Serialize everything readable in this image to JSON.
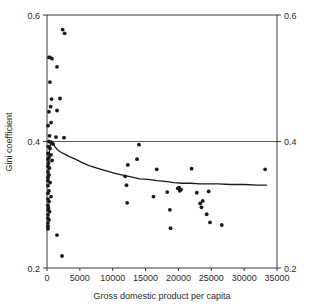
{
  "chart_data": {
    "type": "scatter",
    "title": "",
    "subtitle": "",
    "xlabel": "Gross domestic product per capita",
    "ylabel": "Gini coefficient",
    "xlim": [
      0,
      35000
    ],
    "ylim": [
      0.2,
      0.6
    ],
    "grid": false,
    "legend": null,
    "legend_position": "none",
    "x_ticks": [
      0,
      5000,
      10000,
      15000,
      20000,
      25000,
      30000,
      35000
    ],
    "x_tick_labels": [
      "0",
      "5000",
      "10000",
      "15000",
      "20000",
      "25000",
      "30000",
      "35000"
    ],
    "y_ticks": [
      0.2,
      0.4,
      0.6
    ],
    "y_tick_labels": [
      "0.2",
      "0.4",
      "0.6"
    ],
    "y_ticks_right": [
      0.2,
      0.4,
      0.6
    ],
    "y_tick_labels_right": [
      "0.2",
      "0.4",
      "0.6"
    ],
    "annotations": [
      {
        "type": "horizontal-reference-line",
        "y": 0.4,
        "label": "0.4 reference line"
      }
    ],
    "series": [
      {
        "name": "Countries",
        "type": "scatter",
        "marker": "circle",
        "color": "#1a1a1a",
        "points": [
          [
            2380,
            0.577
          ],
          [
            2680,
            0.571
          ],
          [
            300,
            0.533
          ],
          [
            460,
            0.533
          ],
          [
            760,
            0.531
          ],
          [
            1520,
            0.518
          ],
          [
            440,
            0.494
          ],
          [
            700,
            0.467
          ],
          [
            1980,
            0.468
          ],
          [
            560,
            0.455
          ],
          [
            300,
            0.447
          ],
          [
            1520,
            0.449
          ],
          [
            620,
            0.43
          ],
          [
            160,
            0.425
          ],
          [
            380,
            0.409
          ],
          [
            1370,
            0.407
          ],
          [
            2590,
            0.406
          ],
          [
            300,
            0.4
          ],
          [
            640,
            0.398
          ],
          [
            920,
            0.396
          ],
          [
            200,
            0.392
          ],
          [
            450,
            0.389
          ],
          [
            150,
            0.381
          ],
          [
            610,
            0.379
          ],
          [
            300,
            0.375
          ],
          [
            150,
            0.372
          ],
          [
            760,
            0.37
          ],
          [
            230,
            0.366
          ],
          [
            150,
            0.361
          ],
          [
            380,
            0.358
          ],
          [
            150,
            0.352
          ],
          [
            300,
            0.347
          ],
          [
            150,
            0.343
          ],
          [
            150,
            0.338
          ],
          [
            460,
            0.335
          ],
          [
            150,
            0.33
          ],
          [
            300,
            0.322
          ],
          [
            150,
            0.318
          ],
          [
            610,
            0.313
          ],
          [
            150,
            0.309
          ],
          [
            300,
            0.305
          ],
          [
            150,
            0.299
          ],
          [
            230,
            0.295
          ],
          [
            150,
            0.292
          ],
          [
            380,
            0.289
          ],
          [
            150,
            0.284
          ],
          [
            150,
            0.279
          ],
          [
            300,
            0.276
          ],
          [
            150,
            0.271
          ],
          [
            150,
            0.266
          ],
          [
            150,
            0.262
          ],
          [
            1520,
            0.252
          ],
          [
            2280,
            0.219
          ],
          [
            11900,
            0.345
          ],
          [
            12100,
            0.331
          ],
          [
            12200,
            0.303
          ],
          [
            12300,
            0.363
          ],
          [
            13700,
            0.372
          ],
          [
            14000,
            0.395
          ],
          [
            16200,
            0.313
          ],
          [
            16700,
            0.356
          ],
          [
            18300,
            0.32
          ],
          [
            18700,
            0.292
          ],
          [
            18800,
            0.263
          ],
          [
            19900,
            0.326
          ],
          [
            20100,
            0.327
          ],
          [
            20200,
            0.322
          ],
          [
            20400,
            0.324
          ],
          [
            22000,
            0.357
          ],
          [
            22800,
            0.319
          ],
          [
            23300,
            0.302
          ],
          [
            23500,
            0.296
          ],
          [
            23700,
            0.306
          ],
          [
            24300,
            0.285
          ],
          [
            24600,
            0.321
          ],
          [
            24800,
            0.272
          ],
          [
            26600,
            0.268
          ],
          [
            33200,
            0.356
          ]
        ]
      },
      {
        "name": "Smoothed trend",
        "type": "line",
        "color": "#1a1a1a",
        "points": [
          [
            120,
            0.338
          ],
          [
            250,
            0.368
          ],
          [
            400,
            0.387
          ],
          [
            560,
            0.397
          ],
          [
            700,
            0.401
          ],
          [
            900,
            0.398
          ],
          [
            1200,
            0.392
          ],
          [
            1600,
            0.387
          ],
          [
            2100,
            0.383
          ],
          [
            2700,
            0.38
          ],
          [
            3400,
            0.376
          ],
          [
            4300,
            0.372
          ],
          [
            5300,
            0.367
          ],
          [
            6400,
            0.362
          ],
          [
            7600,
            0.358
          ],
          [
            8900,
            0.354
          ],
          [
            10200,
            0.35
          ],
          [
            11500,
            0.347
          ],
          [
            12800,
            0.344
          ],
          [
            14100,
            0.341
          ],
          [
            15400,
            0.34
          ],
          [
            16700,
            0.338
          ],
          [
            18000,
            0.337
          ],
          [
            19300,
            0.335
          ],
          [
            20600,
            0.334
          ],
          [
            21900,
            0.334
          ],
          [
            23200,
            0.333
          ],
          [
            24500,
            0.333
          ],
          [
            26000,
            0.333
          ],
          [
            28000,
            0.332
          ],
          [
            30000,
            0.332
          ],
          [
            32000,
            0.331
          ],
          [
            33400,
            0.331
          ]
        ]
      }
    ]
  },
  "axes": {
    "left_title": "Gini coefficient",
    "bottom_title": "Gross domestic product per capita"
  }
}
